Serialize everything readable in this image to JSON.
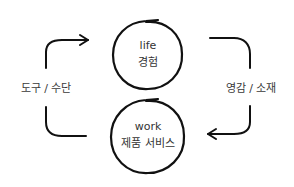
{
  "diagram": {
    "type": "cycle",
    "nodes": [
      {
        "id": "life",
        "title": "life",
        "subtitle": "경험"
      },
      {
        "id": "work",
        "title": "work",
        "subtitle": "제품 서비스"
      }
    ],
    "edges": [
      {
        "from": "work",
        "to": "life",
        "label": "도구 / 수단",
        "side": "left"
      },
      {
        "from": "life",
        "to": "work",
        "label": "영감 / 소재",
        "side": "right"
      }
    ],
    "colors": {
      "stroke": "#111111",
      "text": "#333333",
      "background": "#ffffff"
    }
  }
}
